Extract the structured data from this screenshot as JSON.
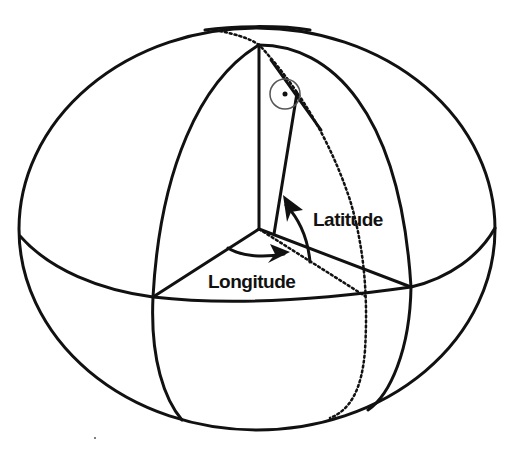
{
  "diagram": {
    "type": "geographic-coordinates-ellipsoid",
    "labels": {
      "latitude": "Latitude",
      "longitude": "Longitude"
    },
    "colors": {
      "stroke": "#111111",
      "background": "#ffffff",
      "symbol": "#555555"
    },
    "elements": [
      "outer-ellipsoid-outline",
      "equator",
      "prime-meridian",
      "reference-meridian",
      "polar-axis",
      "longitude-angle-arc",
      "latitude-angle-arc",
      "surface-normal",
      "right-angle-symbol"
    ]
  }
}
